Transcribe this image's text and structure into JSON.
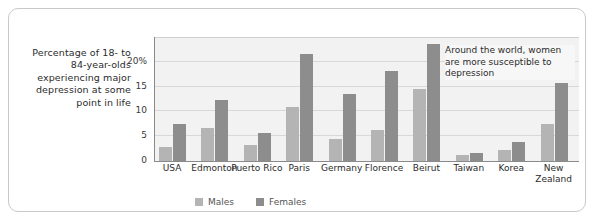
{
  "caption": "Percentage of 18- to 84-year-olds experiencing major depression at some point in life",
  "annotation": "Around the world, women are more susceptible to depression",
  "legend": {
    "males_label": "Males",
    "females_label": "Females",
    "males_color": "#b4b4b4",
    "females_color": "#8d8d8d"
  },
  "colors": {
    "plot_background": "#f2f2f2",
    "gridline": "#d8d8d8",
    "axis": "#8a8a8a",
    "frame_border": "#c9c9c9",
    "text": "#2b2b2b"
  },
  "chart_data": {
    "type": "bar",
    "title": "",
    "xlabel": "",
    "ylabel": "Percentage of 18- to 84-year-olds experiencing major depression at some point in life",
    "ylim": [
      0,
      25
    ],
    "yticks": [
      "0",
      "5",
      "10",
      "15",
      "20%"
    ],
    "ytick_values": [
      0,
      5,
      10,
      15,
      20
    ],
    "grid": true,
    "legend_position": "bottom",
    "categories": [
      "USA",
      "Edmonton",
      "Puerto Rico",
      "Paris",
      "Germany",
      "Florence",
      "Beirut",
      "Taiwan",
      "Korea",
      "New Zealand"
    ],
    "series": [
      {
        "name": "Males",
        "color": "#b4b4b4",
        "values": [
          2.9,
          6.6,
          3.2,
          10.8,
          4.5,
          6.2,
          14.5,
          1.3,
          2.2,
          7.5
        ]
      },
      {
        "name": "Females",
        "color": "#8d8d8d",
        "values": [
          7.4,
          12.4,
          5.6,
          21.5,
          13.5,
          18.2,
          23.5,
          1.7,
          3.8,
          15.7
        ]
      }
    ],
    "annotations": [
      {
        "text": "Around the world, women are more susceptible to depression"
      }
    ]
  }
}
